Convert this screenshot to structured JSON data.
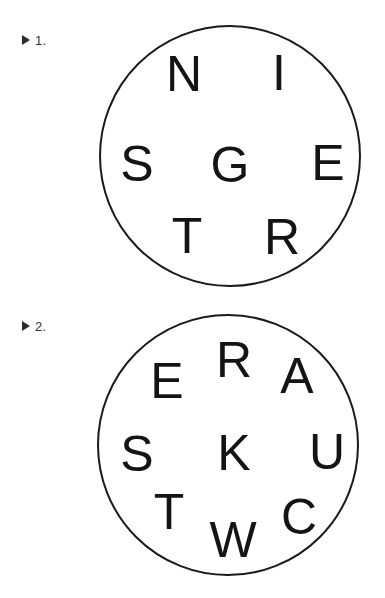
{
  "page": {
    "background_color": "#ffffff",
    "ink_color": "#141414",
    "width": 385,
    "height": 598
  },
  "items": [
    {
      "marker_icon": "triangle-right-icon",
      "number_label": "1.",
      "marker_x": 22,
      "marker_y": 32,
      "circle": {
        "center_x": 230,
        "center_y": 156,
        "radius": 131,
        "stroke_color": "#1a1a1a"
      },
      "letters": [
        {
          "char": "N",
          "x": 184,
          "y": 74
        },
        {
          "char": "I",
          "x": 279,
          "y": 73
        },
        {
          "char": "S",
          "x": 137,
          "y": 164
        },
        {
          "char": "G",
          "x": 230,
          "y": 165
        },
        {
          "char": "E",
          "x": 328,
          "y": 163
        },
        {
          "char": "T",
          "x": 187,
          "y": 236
        },
        {
          "char": "R",
          "x": 282,
          "y": 237
        }
      ]
    },
    {
      "marker_icon": "triangle-right-icon",
      "number_label": "2.",
      "marker_x": 22,
      "marker_y": 318,
      "circle": {
        "center_x": 228,
        "center_y": 445,
        "radius": 131,
        "stroke_color": "#1a1a1a"
      },
      "letters": [
        {
          "char": "R",
          "x": 234,
          "y": 360
        },
        {
          "char": "E",
          "x": 167,
          "y": 381
        },
        {
          "char": "A",
          "x": 297,
          "y": 376
        },
        {
          "char": "S",
          "x": 137,
          "y": 454
        },
        {
          "char": "K",
          "x": 234,
          "y": 453
        },
        {
          "char": "U",
          "x": 327,
          "y": 452
        },
        {
          "char": "T",
          "x": 169,
          "y": 512
        },
        {
          "char": "C",
          "x": 299,
          "y": 517
        },
        {
          "char": "W",
          "x": 233,
          "y": 540
        }
      ]
    }
  ]
}
